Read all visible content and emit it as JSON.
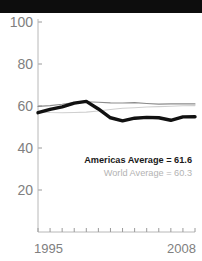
{
  "title_band": {
    "text": "",
    "background_color": "#0d0d0d"
  },
  "chart_data": {
    "type": "line",
    "title": "",
    "subtitle": "",
    "xlabel": "",
    "ylabel": "",
    "xlim": [
      1995,
      2008
    ],
    "ylim": [
      0,
      100
    ],
    "grid": false,
    "legend_position": "inside-lower-right",
    "x": [
      1995,
      1996,
      1997,
      1998,
      1999,
      2000,
      2001,
      2002,
      2003,
      2004,
      2005,
      2006,
      2007,
      2008
    ],
    "y_ticks": [
      20,
      40,
      60,
      80,
      100
    ],
    "y_tick_labels": [
      "20",
      "40",
      "60",
      "80",
      "100"
    ],
    "x_tick_labels_shown": [
      "1995",
      "2008"
    ],
    "x_tick_count": 14,
    "series": [
      {
        "name": "Americas Average",
        "color": "#111111",
        "width": 3.4,
        "values": [
          56.8,
          58.4,
          59.6,
          61.4,
          62.2,
          58.6,
          54.4,
          52.9,
          54.2,
          54.6,
          54.4,
          53.2,
          54.8,
          54.9
        ]
      },
      {
        "name": "Series Mid Gray",
        "color": "#8c8c8c",
        "width": 1.1,
        "values": [
          59.8,
          60.2,
          60.8,
          61.6,
          62.0,
          61.8,
          61.5,
          61.4,
          61.6,
          61.2,
          60.9,
          61.0,
          61.1,
          61.0
        ]
      },
      {
        "name": "World Average",
        "color": "#cfcfcf",
        "width": 1.1,
        "values": [
          57.2,
          56.9,
          56.8,
          56.9,
          57.1,
          57.6,
          58.3,
          58.9,
          59.2,
          59.5,
          59.7,
          59.9,
          60.1,
          60.2
        ]
      }
    ],
    "annotations": [
      {
        "name": "americas-average",
        "label": "Americas Average = 61.6",
        "value": 61.6,
        "color": "#1a1a1a",
        "bold": true
      },
      {
        "name": "world-average",
        "label": "World Average = 60.3",
        "value": 60.3,
        "color": "#b3b3b3",
        "bold": false
      }
    ],
    "axis_color": "#b0b0b0",
    "tick_color": "#9a9a9a",
    "label_color": "#808080"
  }
}
